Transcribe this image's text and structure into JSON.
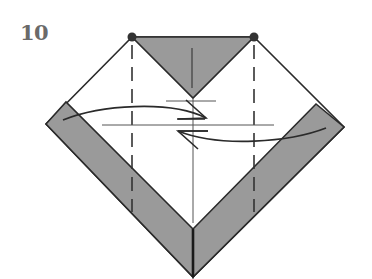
{
  "step": {
    "number": "10"
  },
  "diagram": {
    "type": "origami-fold-step",
    "colors": {
      "paper_white": "#ffffff",
      "paper_colored": "#9a9a9a",
      "outline": "#2a2a2a",
      "guide_line": "#555555",
      "dot": "#333333",
      "number": "#6a6a6a"
    },
    "reference_points": [
      {
        "name": "left-dot",
        "x": 132,
        "y": 37
      },
      {
        "name": "right-dot",
        "x": 254,
        "y": 37
      }
    ],
    "arrows": [
      {
        "name": "left-fold-arrow",
        "direction": "right"
      },
      {
        "name": "right-fold-arrow",
        "direction": "left"
      }
    ],
    "fold_lines": [
      {
        "name": "left-valley-fold",
        "style": "dashed",
        "x": 132
      },
      {
        "name": "right-valley-fold",
        "style": "dashed",
        "x": 254
      }
    ]
  }
}
